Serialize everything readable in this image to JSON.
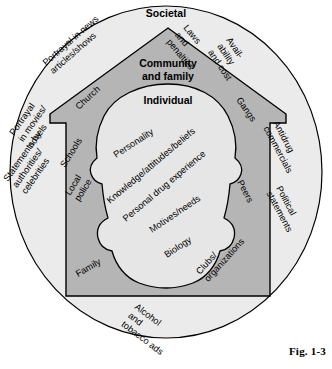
{
  "figure": {
    "caption": "Fig. 1-3",
    "layers": [
      {
        "id": "societal",
        "title": "Societal",
        "fill": "#ebebeb"
      },
      {
        "id": "community",
        "title": "Community\nand family",
        "fill": "#b5b5b5"
      },
      {
        "id": "individual",
        "title": "Individual",
        "fill": "#e6e6e6"
      }
    ],
    "stroke": "#000000",
    "background": "#ffffff"
  },
  "societal_level": {
    "title": "Societal",
    "labels": [
      {
        "id": "portrayal-news",
        "line1": "Portrayal in news",
        "line2": "articles/shows",
        "line3": ""
      },
      {
        "id": "laws-penalties",
        "line1": "Laws",
        "line2": "and",
        "line3": "penalties"
      },
      {
        "id": "availability-cost",
        "line1": "Avail-",
        "line2": "ability",
        "line3": "and cost"
      },
      {
        "id": "antidrug-commercials",
        "line1": "Antidrug",
        "line2": "commercials",
        "line3": ""
      },
      {
        "id": "political-statements",
        "line1": "Political",
        "line2": "statements",
        "line3": ""
      },
      {
        "id": "alcohol-tobacco-ads",
        "line1": "Alcohol",
        "line2": "and",
        "line3": "tobacco ads"
      },
      {
        "id": "statements-authorities",
        "line1": "Statements by",
        "line2": "authorities/",
        "line3": "celebrities"
      },
      {
        "id": "portrayal-movies",
        "line1": "Portrayal",
        "line2": "in movies/",
        "line3": "novels"
      }
    ]
  },
  "community_level": {
    "title_line1": "Community",
    "title_line2": "and family",
    "labels": [
      {
        "id": "church",
        "line1": "Church",
        "line2": ""
      },
      {
        "id": "gangs",
        "line1": "Gangs",
        "line2": ""
      },
      {
        "id": "schools",
        "line1": "Schools",
        "line2": ""
      },
      {
        "id": "peers",
        "line1": "Peers",
        "line2": ""
      },
      {
        "id": "local-police",
        "line1": "Local",
        "line2": "police"
      },
      {
        "id": "clubs-organizations",
        "line1": "Clubs/",
        "line2": "organizations"
      },
      {
        "id": "family",
        "line1": "Family",
        "line2": ""
      }
    ]
  },
  "individual_level": {
    "title": "Individual",
    "labels": [
      {
        "id": "personality",
        "text": "Personality"
      },
      {
        "id": "knowledge-attitudes",
        "text": "Knowledge/attitudes/beliefs"
      },
      {
        "id": "personal-drug-experience",
        "text": "Personal drug experience"
      },
      {
        "id": "motives-needs",
        "text": "Motives/needs"
      },
      {
        "id": "biology",
        "text": "Biology"
      }
    ]
  }
}
